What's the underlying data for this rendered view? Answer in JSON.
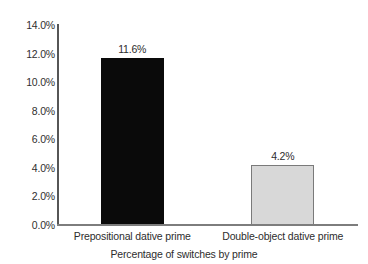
{
  "chart_data": {
    "type": "bar",
    "title": "",
    "subtitle": "",
    "xlabel": "Percentage of switches by prime",
    "ylabel": "",
    "categories": [
      "Prepositional dative prime",
      "Double-object dative prime"
    ],
    "values": [
      11.6,
      4.2
    ],
    "data_labels": [
      "11.6%",
      "4.2%"
    ],
    "ylim": [
      0,
      14
    ],
    "ytick_values": [
      14,
      12,
      10,
      8,
      6,
      4,
      2,
      0
    ],
    "ytick_labels": [
      "14.0%",
      "12.0%",
      "10.0%",
      "8.0%",
      "6.0%",
      "4.0%",
      "2.0%",
      "0.0%"
    ],
    "grid": false,
    "legend": false,
    "legend_position": "none",
    "bar_colors": [
      "#0a0a0a",
      "#d8d8d8"
    ],
    "bar_border_colors": [
      "#0a0a0a",
      "#7a7a7a"
    ],
    "axis_color": "#565656",
    "baseline_color": "#7d7d7d",
    "background_color": "#ffffff",
    "text_color": "#2d2d2d"
  }
}
